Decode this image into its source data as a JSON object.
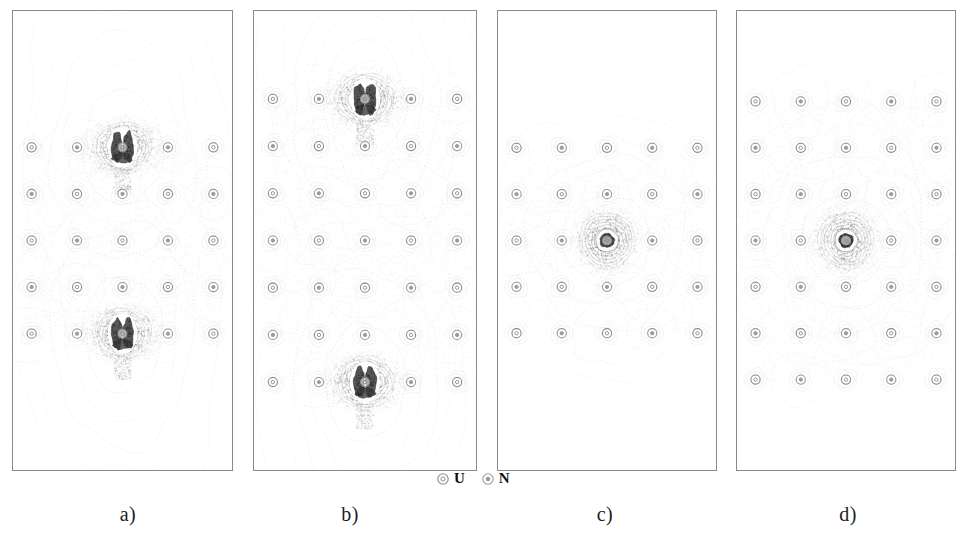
{
  "figure": {
    "caption_labels": [
      "a)",
      "b)",
      "c)",
      "d)"
    ],
    "background_color": "#ffffff",
    "border_color": "#8a8a8a",
    "contour_color": "#9aa0c8",
    "density_color": "#4a4a4a"
  },
  "legend": {
    "position": "bottom-center",
    "entries": [
      {
        "symbol": "U",
        "marker": "open-ring-small-core-icon",
        "color": "#8f8f8f"
      },
      {
        "symbol": "N",
        "marker": "open-ring-filled-core-icon",
        "color": "#9a9a9a"
      }
    ]
  },
  "chart_data": {
    "type": "heatmap",
    "title": "",
    "xlabel": "",
    "ylabel": "",
    "panel_count": 4,
    "plot_kind": "electron-density contour map",
    "panels": [
      {
        "id": "a",
        "label": "a)",
        "grid": {
          "cols": 5,
          "rows": 5
        },
        "atom_species": [
          "U",
          "N"
        ],
        "atom_rows": [
          [
            "U",
            "N",
            "U",
            "N",
            "U"
          ],
          [
            "N",
            "U",
            "N",
            "U",
            "N"
          ],
          [
            "U",
            "N",
            "U",
            "N",
            "U"
          ],
          [
            "N",
            "U",
            "N",
            "U",
            "N"
          ],
          [
            "U",
            "N",
            "U",
            "N",
            "U"
          ]
        ],
        "density_maxima": [
          {
            "col": 2,
            "row": 0,
            "intensity": 1.0,
            "shape": "split-lobe"
          },
          {
            "col": 2,
            "row": 4,
            "intensity": 1.0,
            "shape": "split-lobe"
          }
        ],
        "halo_extent": "vertical-elongated",
        "contour_levels": 14
      },
      {
        "id": "b",
        "label": "b)",
        "grid": {
          "cols": 5,
          "rows": 7
        },
        "atom_species": [
          "U",
          "N"
        ],
        "atom_rows": [
          [
            "U",
            "N",
            "U",
            "N",
            "U"
          ],
          [
            "N",
            "U",
            "N",
            "U",
            "N"
          ],
          [
            "U",
            "N",
            "U",
            "N",
            "U"
          ],
          [
            "N",
            "U",
            "N",
            "U",
            "N"
          ],
          [
            "U",
            "N",
            "U",
            "N",
            "U"
          ],
          [
            "N",
            "U",
            "N",
            "U",
            "N"
          ],
          [
            "U",
            "N",
            "U",
            "N",
            "U"
          ]
        ],
        "density_maxima": [
          {
            "col": 2,
            "row": 0,
            "intensity": 1.0,
            "shape": "split-lobe"
          },
          {
            "col": 2,
            "row": 6,
            "intensity": 1.0,
            "shape": "split-lobe"
          }
        ],
        "halo_extent": "vertical-elongated",
        "contour_levels": 14
      },
      {
        "id": "c",
        "label": "c)",
        "grid": {
          "cols": 5,
          "rows": 5
        },
        "atom_species": [
          "U",
          "N"
        ],
        "atom_rows": [
          [
            "U",
            "N",
            "U",
            "N",
            "U"
          ],
          [
            "N",
            "U",
            "N",
            "U",
            "N"
          ],
          [
            "U",
            "N",
            "U",
            "N",
            "U"
          ],
          [
            "N",
            "U",
            "N",
            "U",
            "N"
          ],
          [
            "U",
            "N",
            "U",
            "N",
            "U"
          ]
        ],
        "density_maxima": [
          {
            "col": 2,
            "row": 2,
            "intensity": 1.0,
            "shape": "radial-ring"
          }
        ],
        "halo_extent": "radial-symmetric",
        "contour_levels": 14
      },
      {
        "id": "d",
        "label": "d)",
        "grid": {
          "cols": 5,
          "rows": 7
        },
        "atom_species": [
          "U",
          "N"
        ],
        "atom_rows": [
          [
            "U",
            "N",
            "U",
            "N",
            "U"
          ],
          [
            "N",
            "U",
            "N",
            "U",
            "N"
          ],
          [
            "U",
            "N",
            "U",
            "N",
            "U"
          ],
          [
            "N",
            "U",
            "N",
            "U",
            "N"
          ],
          [
            "U",
            "N",
            "U",
            "N",
            "U"
          ],
          [
            "N",
            "U",
            "N",
            "U",
            "N"
          ],
          [
            "U",
            "N",
            "U",
            "N",
            "U"
          ]
        ],
        "density_maxima": [
          {
            "col": 2,
            "row": 3,
            "intensity": 1.0,
            "shape": "radial-ring"
          }
        ],
        "halo_extent": "radial-symmetric",
        "contour_levels": 14
      }
    ]
  }
}
